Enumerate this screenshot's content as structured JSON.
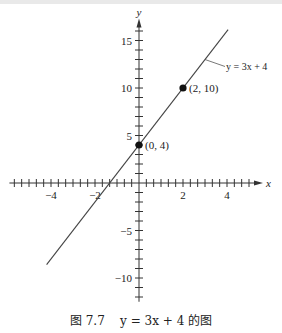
{
  "chart_data": {
    "type": "line",
    "title": "",
    "caption": "图 7.7    y = 3x + 4 的图",
    "xlabel": "x",
    "ylabel": "y",
    "xlim": [
      -5.8,
      5.5
    ],
    "ylim": [
      -12.5,
      17
    ],
    "x_tick_labels": [
      "-4",
      "-2",
      "2",
      "4"
    ],
    "x_tick_values": [
      -4,
      -2,
      2,
      4
    ],
    "x_minor_tick_step": 0.3333,
    "y_tick_labels": [
      "15",
      "10",
      "5",
      "-5",
      "-10"
    ],
    "y_tick_values": [
      15,
      10,
      5,
      -5,
      -10
    ],
    "y_minor_tick_step": 1,
    "grid": false,
    "series": [
      {
        "name": "y = 3x + 4",
        "equation": "y = 3x + 4",
        "slope": 3,
        "intercept": 4,
        "x": [
          -4.2,
          4.05
        ],
        "y": [
          -8.6,
          16.15
        ]
      }
    ],
    "points": [
      {
        "x": 0,
        "y": 4,
        "label": "(0, 4)"
      },
      {
        "x": 2,
        "y": 10,
        "label": "(2, 10)"
      }
    ],
    "annotations": [
      {
        "text": "y = 3x + 4",
        "attached_to": "line",
        "at_x": 3.0
      }
    ]
  },
  "labels": {
    "x_axis": "x",
    "y_axis": "y",
    "line_label": "y = 3x + 4",
    "point_a": "(0, 4)",
    "point_b": "(2, 10)",
    "caption_prefix": "图 7.7",
    "caption_eq": "y = 3x + 4",
    "caption_suffix": "的图"
  }
}
